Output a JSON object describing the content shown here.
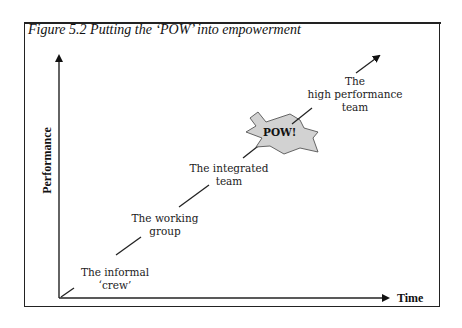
{
  "figure": {
    "title": "Figure 5.2  Putting the ‘POW’ into empowerment"
  },
  "axes": {
    "x_label": "Time",
    "y_label": "Performance"
  },
  "stages": [
    {
      "line1": "The informal",
      "line2": "‘crew’"
    },
    {
      "line1": "The working",
      "line2": "group"
    },
    {
      "line1": "The integrated",
      "line2": "team"
    },
    {
      "line0": "The",
      "line1": "high performance",
      "line2": "team"
    }
  ],
  "burst": {
    "label": "POW!",
    "fill": "#d2d2d2"
  },
  "colors": {
    "ink": "#222222",
    "background": "#ffffff"
  }
}
